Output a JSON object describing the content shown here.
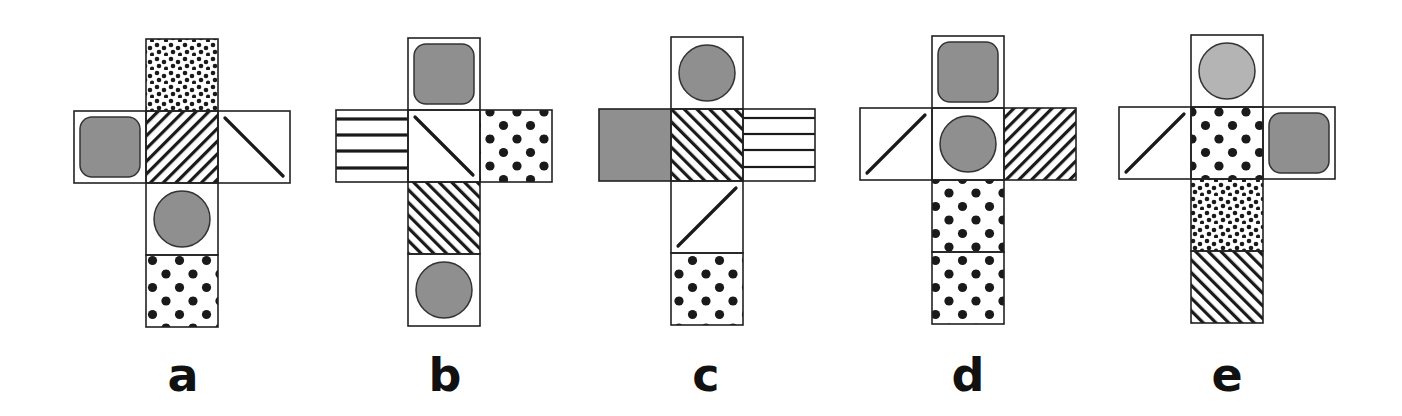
{
  "figure": {
    "face_size_px": 72,
    "colors": {
      "gray_fill": "#8f8f8f",
      "light_gray_fill": "#b4b4b4",
      "line": "#1a1a1a",
      "background": "#ffffff"
    }
  },
  "nets": [
    {
      "label": "a",
      "origin": [
        74,
        39
      ],
      "faces": [
        {
          "col": 1,
          "row": 0,
          "pattern": "fine-dots"
        },
        {
          "col": 0,
          "row": 1,
          "pattern": "rounded-square"
        },
        {
          "col": 1,
          "row": 1,
          "pattern": "diagonal-stripes-up"
        },
        {
          "col": 2,
          "row": 1,
          "pattern": "diagonal-line-down"
        },
        {
          "col": 1,
          "row": 2,
          "pattern": "circle"
        },
        {
          "col": 1,
          "row": 3,
          "pattern": "large-dots"
        }
      ]
    },
    {
      "label": "b",
      "origin": [
        336,
        38
      ],
      "faces": [
        {
          "col": 1,
          "row": 0,
          "pattern": "rounded-square"
        },
        {
          "col": 0,
          "row": 1,
          "pattern": "horizontal-stripes"
        },
        {
          "col": 1,
          "row": 1,
          "pattern": "diagonal-line-down"
        },
        {
          "col": 2,
          "row": 1,
          "pattern": "large-dots"
        },
        {
          "col": 1,
          "row": 2,
          "pattern": "diagonal-stripes-down"
        },
        {
          "col": 1,
          "row": 3,
          "pattern": "circle"
        }
      ]
    },
    {
      "label": "c",
      "origin": [
        599,
        37
      ],
      "faces": [
        {
          "col": 1,
          "row": 0,
          "pattern": "circle"
        },
        {
          "col": 0,
          "row": 1,
          "pattern": "solid-gray"
        },
        {
          "col": 1,
          "row": 1,
          "pattern": "diagonal-stripes-down"
        },
        {
          "col": 2,
          "row": 1,
          "pattern": "horizontal-stripes-thin"
        },
        {
          "col": 1,
          "row": 2,
          "pattern": "diagonal-line-up"
        },
        {
          "col": 1,
          "row": 3,
          "pattern": "large-dots"
        }
      ]
    },
    {
      "label": "d",
      "origin": [
        860,
        36
      ],
      "faces": [
        {
          "col": 1,
          "row": 0,
          "pattern": "rounded-square"
        },
        {
          "col": 0,
          "row": 1,
          "pattern": "diagonal-line-up"
        },
        {
          "col": 1,
          "row": 1,
          "pattern": "circle"
        },
        {
          "col": 2,
          "row": 1,
          "pattern": "diagonal-stripes-up"
        },
        {
          "col": 1,
          "row": 2,
          "pattern": "large-dots"
        },
        {
          "col": 1,
          "row": 3,
          "pattern": "large-dots"
        }
      ]
    },
    {
      "label": "e",
      "origin": [
        1119,
        35
      ],
      "faces": [
        {
          "col": 1,
          "row": 0,
          "pattern": "circle-light"
        },
        {
          "col": 0,
          "row": 1,
          "pattern": "diagonal-line-up"
        },
        {
          "col": 1,
          "row": 1,
          "pattern": "large-dots"
        },
        {
          "col": 2,
          "row": 1,
          "pattern": "rounded-square"
        },
        {
          "col": 1,
          "row": 2,
          "pattern": "fine-dots"
        },
        {
          "col": 1,
          "row": 3,
          "pattern": "diagonal-stripes-down"
        }
      ]
    }
  ],
  "labels": [
    {
      "text": "a",
      "x": 183
    },
    {
      "text": "b",
      "x": 445
    },
    {
      "text": "c",
      "x": 706
    },
    {
      "text": "d",
      "x": 968
    },
    {
      "text": "e",
      "x": 1227
    }
  ]
}
